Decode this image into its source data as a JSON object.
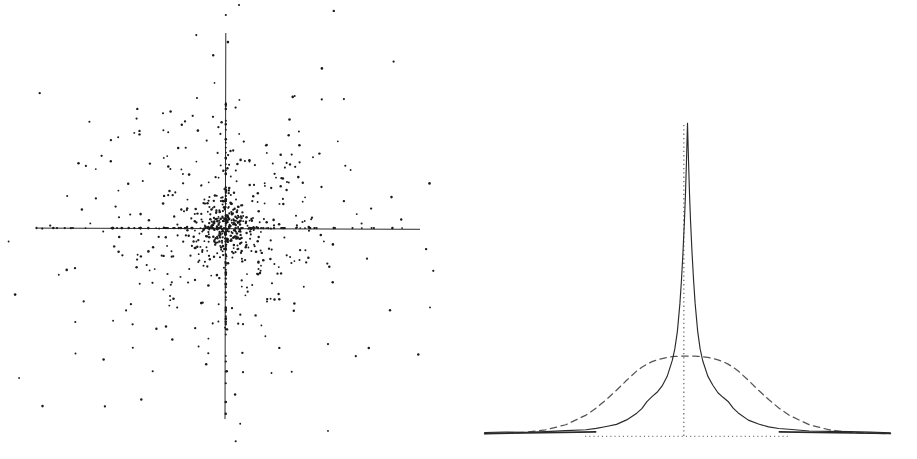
{
  "figure": {
    "title": "",
    "panel_count": 2,
    "background_color": "#ffffff",
    "ink_color": "#1a1a1a"
  },
  "panels": [
    {
      "id": "scatter",
      "name": "scatter-plot-panel",
      "label": "",
      "type": "scatter"
    },
    {
      "id": "density",
      "name": "density-plot-panel",
      "label": "",
      "type": "line"
    }
  ],
  "chart_data": [
    {
      "type": "scatter",
      "title": "",
      "subtitle": "",
      "xlabel": "",
      "ylabel": "",
      "legend": [],
      "grid": false,
      "axes": {
        "style": "crossed-axes-through-origin",
        "x_axis_y_pixel_fraction": 0.497,
        "y_axis_x_pixel_fraction": 0.493,
        "x_axis_span_fraction": [
          0.083,
          0.917
        ],
        "y_axis_span_fraction": [
          0.072,
          0.913
        ],
        "tick_labels_x": [],
        "tick_labels_y": [],
        "xlim": [
          -1,
          1
        ],
        "ylim": [
          -1,
          1
        ]
      },
      "description": "Bivariate scatter of approximately 900 points, extremely heavy mass at the origin, with pronounced spikes of points lying exactly on the x=0 and y=0 axes; heavy tails in all four quadrants.",
      "n_points": 900,
      "marker": {
        "shape": "circle",
        "size_px": 2.1,
        "color": "#1a1a1a"
      },
      "distribution": {
        "core_fraction": 0.3,
        "core_scale": 0.022,
        "mid_fraction": 0.34,
        "mid_scale": 0.085,
        "tail_fraction": 0.16,
        "tail_scale": 0.3,
        "on_x_axis_fraction": 0.1,
        "on_y_axis_fraction": 0.1
      },
      "random_seed": 20240517
    },
    {
      "type": "line",
      "title": "",
      "subtitle": "",
      "xlabel": "",
      "ylabel": "",
      "grid": false,
      "legend": [
        {
          "name": "Empirical density",
          "style": "solid",
          "color": "#2a2a2a"
        },
        {
          "name": "Normal reference",
          "style": "dashed",
          "color": "#555555"
        }
      ],
      "legend_position": "none",
      "axes": {
        "baseline_style": "dotted",
        "baseline_y_fraction": 0.945,
        "baseline_span_fraction": [
          0.277,
          0.723
        ],
        "center_line_style": "dotted",
        "center_x_fraction": 0.492,
        "center_line_top_fraction": 0.268,
        "xlim": [
          -4,
          4
        ],
        "ylim": [
          0,
          1.0
        ],
        "tick_labels_x": [],
        "tick_labels_y": []
      },
      "description": "Leptokurtic empirical density (solid) with a very tall narrow peak and long flat tails, overlaid on a dashed normal density with the same variance; the normal curve is much lower and wider at the shoulders and crosses the empirical curve near +/-0.8 and again in the far tails.",
      "x": [
        -4.0,
        -3.6,
        -3.2,
        -2.8,
        -2.4,
        -2.0,
        -1.8,
        -1.6,
        -1.4,
        -1.2,
        -1.0,
        -0.9,
        -0.8,
        -0.7,
        -0.6,
        -0.5,
        -0.4,
        -0.3,
        -0.25,
        -0.2,
        -0.15,
        -0.12,
        -0.09,
        -0.06,
        -0.04,
        -0.02,
        0.0,
        0.02,
        0.04,
        0.06,
        0.09,
        0.12,
        0.15,
        0.2,
        0.25,
        0.3,
        0.4,
        0.5,
        0.6,
        0.7,
        0.8,
        0.9,
        1.0,
        1.2,
        1.4,
        1.6,
        1.8,
        2.0,
        2.4,
        2.8,
        3.2,
        3.6,
        4.0
      ],
      "series": [
        {
          "name": "Empirical density",
          "style": "solid",
          "color": "#2a2a2a",
          "values": [
            0.004,
            0.005,
            0.006,
            0.007,
            0.009,
            0.013,
            0.017,
            0.023,
            0.031,
            0.044,
            0.066,
            0.082,
            0.104,
            0.118,
            0.133,
            0.155,
            0.186,
            0.236,
            0.272,
            0.33,
            0.42,
            0.492,
            0.582,
            0.686,
            0.77,
            0.88,
            1.0,
            0.88,
            0.77,
            0.686,
            0.582,
            0.492,
            0.42,
            0.33,
            0.272,
            0.236,
            0.186,
            0.155,
            0.133,
            0.118,
            0.104,
            0.082,
            0.066,
            0.044,
            0.031,
            0.023,
            0.017,
            0.013,
            0.009,
            0.007,
            0.006,
            0.005,
            0.004
          ]
        },
        {
          "name": "Normal reference",
          "style": "dashed",
          "color": "#555555",
          "values": [
            0.0005,
            0.0016,
            0.0048,
            0.0125,
            0.029,
            0.06,
            0.083,
            0.11,
            0.14,
            0.172,
            0.202,
            0.214,
            0.224,
            0.232,
            0.238,
            0.242,
            0.2455,
            0.248,
            0.2488,
            0.2494,
            0.2498,
            0.2499,
            0.25,
            0.25,
            0.25,
            0.25,
            0.25,
            0.25,
            0.25,
            0.25,
            0.25,
            0.2499,
            0.2498,
            0.2494,
            0.2488,
            0.248,
            0.2455,
            0.242,
            0.238,
            0.232,
            0.224,
            0.214,
            0.202,
            0.172,
            0.14,
            0.11,
            0.083,
            0.06,
            0.029,
            0.0125,
            0.0048,
            0.0016,
            0.0005
          ]
        }
      ],
      "annotations": []
    }
  ]
}
